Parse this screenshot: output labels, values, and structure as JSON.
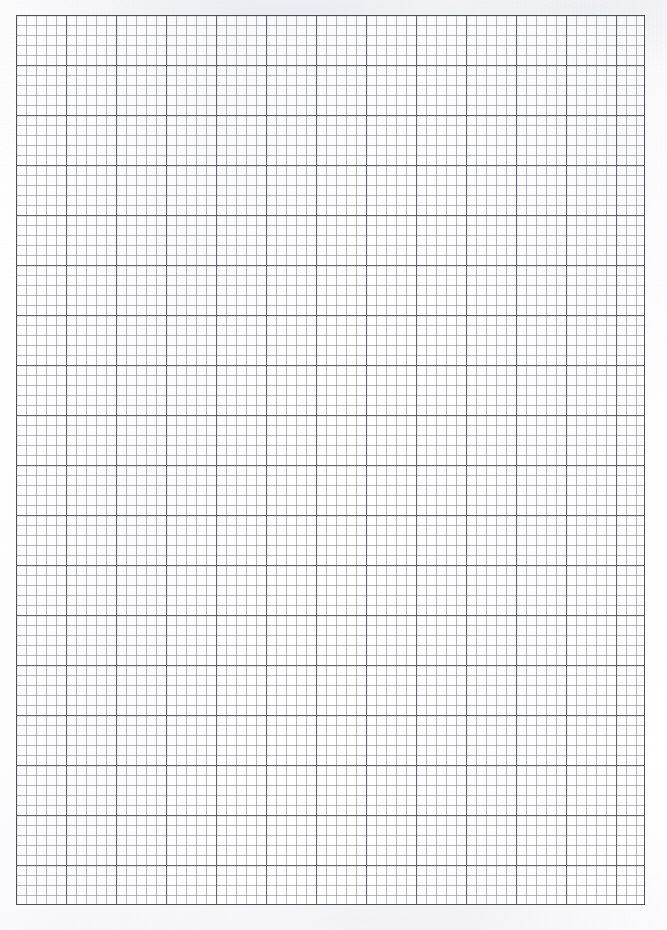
{
  "document": {
    "type": "graph-paper-scan",
    "title": "Blank graph paper sheet",
    "caption": "Scanned blank sheet of grid / graph paper",
    "page_width_px": 667,
    "page_height_px": 930,
    "background_color": "#fefefe"
  },
  "grid": {
    "name": "graph-paper-grid",
    "left_px": 16,
    "top_px": 15,
    "width_px": 629,
    "height_px": 890,
    "minor_cell_px": 10,
    "major_every_n_cells": 5,
    "major_cell_px": 50,
    "minor_columns": 63,
    "minor_rows": 89,
    "major_columns": 13,
    "major_rows": 18,
    "minor_line_color": "#787b84",
    "major_line_color": "#5a5c64",
    "border_color": "#50525a",
    "paper_color": "#ffffff"
  },
  "annotations": {
    "text_content": "",
    "marks": "",
    "labels": []
  }
}
